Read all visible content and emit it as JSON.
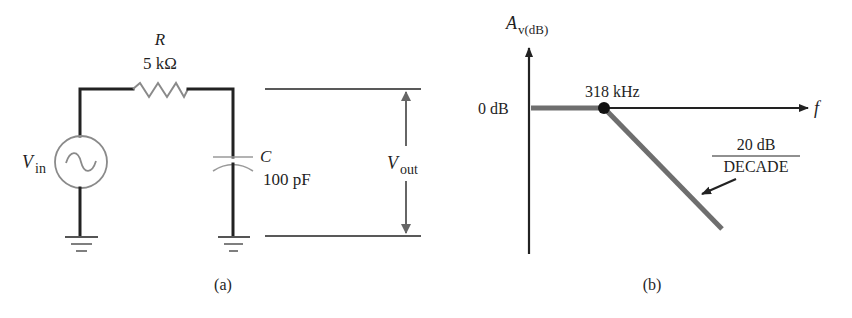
{
  "figure_a": {
    "caption": "(a)",
    "resistor": {
      "symbol": "R",
      "value": "5 kΩ"
    },
    "capacitor": {
      "symbol": "C",
      "value": "100 pF"
    },
    "source": {
      "symbol": "V",
      "subscript": "in"
    },
    "output": {
      "symbol": "V",
      "subscript": "out"
    }
  },
  "figure_b": {
    "caption": "(b)",
    "y_axis": {
      "symbol": "A",
      "subscript": "v(dB)"
    },
    "x_axis": {
      "symbol": "f"
    },
    "level_label": "0 dB",
    "breakpoint_label": "318 kHz",
    "slope": {
      "numerator": "20 dB",
      "denominator": "DECADE"
    }
  },
  "colors": {
    "wire": "#222222",
    "response_curve": "#6e6e6e",
    "component_gray": "#8a8a8a",
    "text": "#1f1f1f"
  }
}
